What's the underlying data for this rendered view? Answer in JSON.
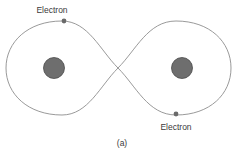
{
  "figure": {
    "caption": "(a)",
    "labels": {
      "top_electron": "Electron",
      "bottom_electron": "Electron"
    },
    "colors": {
      "orbit": "#9a9a9a",
      "nucleus_fill": "#6e6e6e",
      "nucleus_stroke": "#4a4a4a",
      "electron": "#6a6a6a",
      "text": "#3a3a3a"
    },
    "elements": {
      "nuclei": 2,
      "electrons": 2,
      "orbit_shape": "figure-eight"
    }
  }
}
